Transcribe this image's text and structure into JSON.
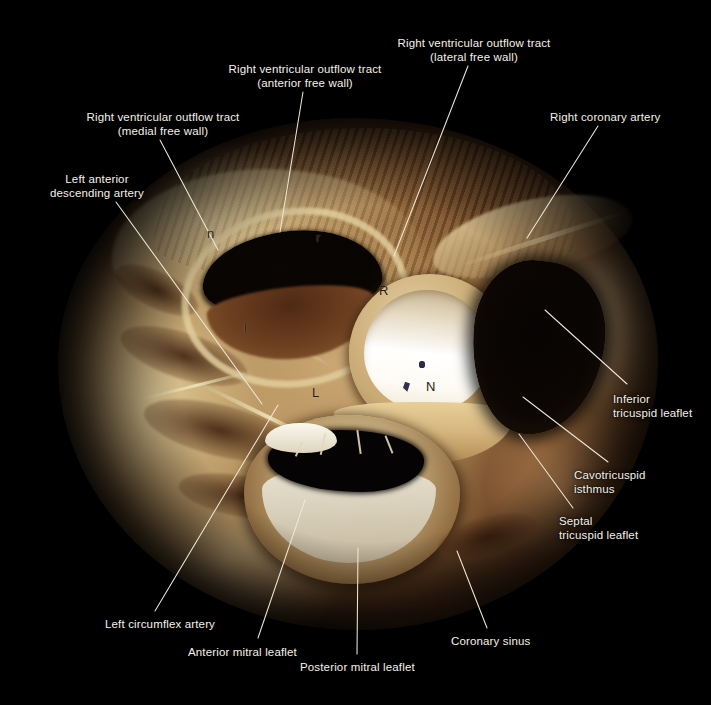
{
  "figure": {
    "kind": "anatomical-photograph",
    "background_color": "#000000",
    "label_color": "#f4f1ea",
    "leader_color": "#efe7d4",
    "tissue_colors": {
      "pale_myocardium": "#c9a672",
      "dark_myocardium": "#6e4322",
      "valve_white": "#ffffff",
      "cavity_black": "#070402",
      "fibrous_tissue": "#e2ce9c"
    }
  },
  "labels": [
    {
      "id": "rvot-lateral",
      "lines": [
        "Right ventricular outflow tract",
        "(lateral free wall)"
      ],
      "align": "center",
      "text_x": 474,
      "text_y": 36,
      "leader": {
        "x1": 468,
        "y1": 66,
        "x2": 394,
        "y2": 256
      }
    },
    {
      "id": "rvot-anterior",
      "lines": [
        "Right ventricular outflow tract",
        "(anterior free wall)"
      ],
      "align": "center",
      "text_x": 305,
      "text_y": 62,
      "leader": {
        "x1": 303,
        "y1": 92,
        "x2": 280,
        "y2": 232
      }
    },
    {
      "id": "rvot-medial",
      "lines": [
        "Right ventricular outflow tract",
        "(medial free wall)"
      ],
      "align": "center",
      "text_x": 163,
      "text_y": 110,
      "leader": {
        "x1": 160,
        "y1": 140,
        "x2": 218,
        "y2": 250
      }
    },
    {
      "id": "right-coronary-artery",
      "lines": [
        "Right coronary artery"
      ],
      "align": "left",
      "text_x": 550,
      "text_y": 110,
      "leader": {
        "x1": 598,
        "y1": 126,
        "x2": 527,
        "y2": 238
      }
    },
    {
      "id": "left-anterior-descending-artery",
      "lines": [
        "Left anterior",
        "descending artery"
      ],
      "align": "center",
      "text_x": 97,
      "text_y": 172,
      "leader": {
        "x1": 116,
        "y1": 202,
        "x2": 262,
        "y2": 404
      }
    },
    {
      "id": "inferior-tricuspid-leaflet",
      "lines": [
        "Inferior",
        "tricuspid leaflet"
      ],
      "align": "left",
      "text_x": 613,
      "text_y": 392,
      "leader": {
        "x1": 627,
        "y1": 384,
        "x2": 545,
        "y2": 310
      }
    },
    {
      "id": "cavotricuspid-isthmus",
      "lines": [
        "Cavotricuspid",
        "isthmus"
      ],
      "align": "left",
      "text_x": 574,
      "text_y": 468,
      "leader": {
        "x1": 608,
        "y1": 462,
        "x2": 523,
        "y2": 397
      }
    },
    {
      "id": "septal-tricuspid-leaflet",
      "lines": [
        "Septal",
        "tricuspid leaflet"
      ],
      "align": "left",
      "text_x": 559,
      "text_y": 514,
      "leader": {
        "x1": 573,
        "y1": 508,
        "x2": 519,
        "y2": 434
      }
    },
    {
      "id": "coronary-sinus",
      "lines": [
        "Coronary sinus"
      ],
      "align": "left",
      "text_x": 451,
      "text_y": 634,
      "leader": {
        "x1": 487,
        "y1": 628,
        "x2": 457,
        "y2": 551
      }
    },
    {
      "id": "posterior-mitral-leaflet",
      "lines": [
        "Posterior mitral leaflet"
      ],
      "align": "left",
      "text_x": 300,
      "text_y": 660,
      "leader": {
        "x1": 357,
        "y1": 654,
        "x2": 358,
        "y2": 548
      }
    },
    {
      "id": "anterior-mitral-leaflet",
      "lines": [
        "Anterior mitral leaflet"
      ],
      "align": "left",
      "text_x": 188,
      "text_y": 645,
      "leader": {
        "x1": 258,
        "y1": 638,
        "x2": 305,
        "y2": 500
      }
    },
    {
      "id": "left-circumflex-artery",
      "lines": [
        "Left circumflex artery"
      ],
      "align": "left",
      "text_x": 105,
      "text_y": 617,
      "leader": {
        "x1": 155,
        "y1": 611,
        "x2": 278,
        "y2": 405
      }
    }
  ],
  "valve_markers": [
    {
      "id": "pulmonary-non-facing-cusp",
      "letter": "n",
      "x": 207,
      "y": 226,
      "case": "upper"
    },
    {
      "id": "pulmonary-right-facing-cusp",
      "letter": "r",
      "x": 316,
      "y": 230,
      "case": "upper"
    },
    {
      "id": "pulmonary-left-facing-cusp",
      "letter": "l",
      "x": 244,
      "y": 320,
      "case": "upper"
    },
    {
      "id": "aortic-right-coronary-cusp",
      "letter": "R",
      "x": 379,
      "y": 283,
      "case": "upper"
    },
    {
      "id": "aortic-left-coronary-cusp",
      "letter": "L",
      "x": 312,
      "y": 385,
      "case": "upper"
    },
    {
      "id": "aortic-non-coronary-cusp",
      "letter": "N",
      "x": 426,
      "y": 379,
      "case": "upper"
    }
  ]
}
